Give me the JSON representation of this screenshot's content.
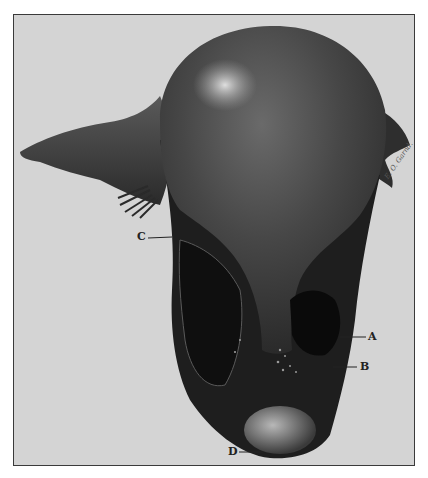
{
  "figure": {
    "type": "anatomical illustration",
    "background_color": "#d4d4d4",
    "frame_color": "#3a3a3a",
    "specimen_color": "#3b3b3b",
    "labels": [
      {
        "id": "C",
        "text": "C"
      },
      {
        "id": "A",
        "text": "A"
      },
      {
        "id": "B",
        "text": "B"
      },
      {
        "id": "D",
        "text": "D"
      }
    ],
    "signature": "E. O. Garnd."
  }
}
